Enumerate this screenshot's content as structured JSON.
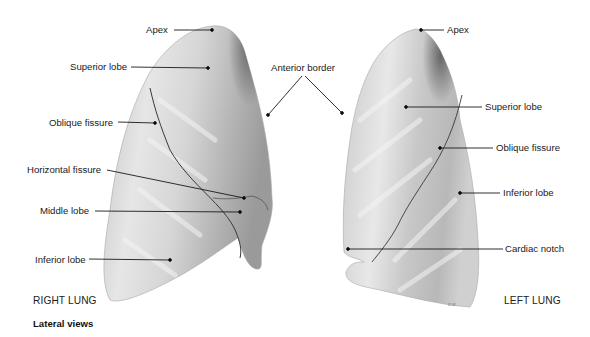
{
  "figure": {
    "caption": "Lateral views",
    "right_lung": {
      "title": "RIGHT LUNG",
      "labels": [
        {
          "id": "apex",
          "text": "Apex"
        },
        {
          "id": "superior-lobe",
          "text": "Superior lobe"
        },
        {
          "id": "oblique-fissure",
          "text": "Oblique fissure"
        },
        {
          "id": "horizontal-fissure",
          "text": "Horizontal fissure"
        },
        {
          "id": "middle-lobe",
          "text": "Middle lobe"
        },
        {
          "id": "inferior-lobe",
          "text": "Inferior lobe"
        }
      ]
    },
    "shared_labels": [
      {
        "id": "anterior-border",
        "text": "Anterior border"
      }
    ],
    "left_lung": {
      "title": "LEFT LUNG",
      "labels": [
        {
          "id": "apex",
          "text": "Apex"
        },
        {
          "id": "superior-lobe",
          "text": "Superior lobe"
        },
        {
          "id": "oblique-fissure",
          "text": "Oblique fissure"
        },
        {
          "id": "inferior-lobe",
          "text": "Inferior lobe"
        },
        {
          "id": "cardiac-notch",
          "text": "Cardiac notch"
        }
      ]
    },
    "artist_signature": "D.M.",
    "colors": {
      "background": "#ffffff",
      "lung_light": "#e4e4e4",
      "lung_mid": "#c4c4c4",
      "lung_dark": "#6e6e6e",
      "leader_line": "#1a1a1a",
      "text": "#1a1a1a"
    }
  }
}
